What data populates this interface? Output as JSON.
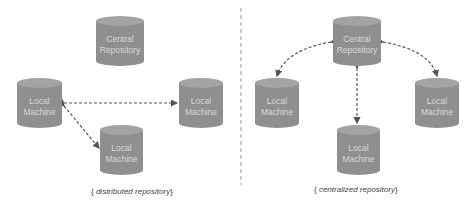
{
  "left_panel": {
    "caption": "distributed repository",
    "nodes": [
      {
        "id": "central",
        "label": "Central\nRepository"
      },
      {
        "id": "local-left",
        "label": "Local\nMachine"
      },
      {
        "id": "local-right",
        "label": "Local\nMachine"
      },
      {
        "id": "local-bottom",
        "label": "Local\nMachine"
      }
    ]
  },
  "right_panel": {
    "caption": "centralized repository",
    "nodes": [
      {
        "id": "central",
        "label": "Central\nRepository"
      },
      {
        "id": "local-left",
        "label": "Local\nMachine"
      },
      {
        "id": "local-right",
        "label": "Local\nMachine"
      },
      {
        "id": "local-bottom",
        "label": "Local\nMachine"
      }
    ]
  },
  "brackets": {
    "open": "{",
    "close": "}"
  },
  "colors": {
    "cylinder": "#8f8f8f",
    "cylinder_top": "#a3a3a3",
    "label": "#d8d8d8",
    "arrow": "#555555",
    "divider": "#999999"
  }
}
